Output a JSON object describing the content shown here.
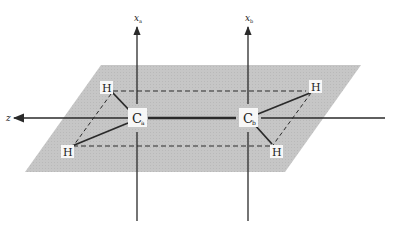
{
  "diagram": {
    "type": "molecular-geometry",
    "colors": {
      "plane": "#c4c4c4",
      "line": "#2a2a2a",
      "background": "#ffffff"
    },
    "axes": {
      "z_label": "z",
      "xa_label": "x",
      "xa_subscript": "a",
      "xb_label": "x",
      "xb_subscript": "b"
    },
    "atoms": {
      "carbon_a": {
        "symbol": "C",
        "subscript": "a"
      },
      "carbon_b": {
        "symbol": "C",
        "subscript": "b"
      },
      "h_upper_left": {
        "symbol": "H"
      },
      "h_lower_left": {
        "symbol": "H"
      },
      "h_upper_right": {
        "symbol": "H"
      },
      "h_lower_right": {
        "symbol": "H"
      }
    }
  }
}
